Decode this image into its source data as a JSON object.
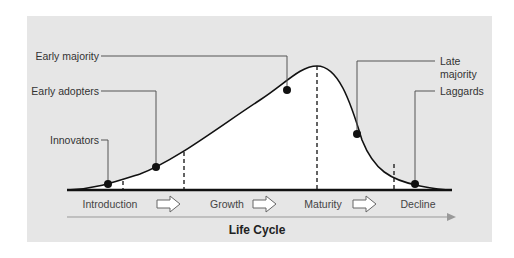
{
  "diagram": {
    "title": "Life Cycle",
    "colors": {
      "panel_bg": "#e6e6e6",
      "curve_fill": "#ffffff",
      "curve_stroke": "#111111",
      "leader_line": "#555555",
      "dot": "#111111",
      "axis_arrow": "#999999"
    },
    "adopter_labels": [
      {
        "id": "innovators",
        "label": "Innovators"
      },
      {
        "id": "early-adopters",
        "label": "Early adopters"
      },
      {
        "id": "early-majority",
        "label": "Early majority"
      },
      {
        "id": "late-majority",
        "label_line1": "Late",
        "label_line2": "majority"
      },
      {
        "id": "laggards",
        "label": "Laggards"
      }
    ],
    "stages": [
      {
        "id": "introduction",
        "label": "Introduction"
      },
      {
        "id": "growth",
        "label": "Growth"
      },
      {
        "id": "maturity",
        "label": "Maturity"
      },
      {
        "id": "decline",
        "label": "Decline"
      }
    ],
    "stage_arrow_icon": "right-arrow-outline"
  }
}
